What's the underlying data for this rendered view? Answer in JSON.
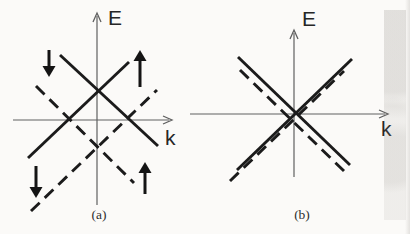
{
  "figure": {
    "background_color": "#fbfaf8",
    "band_color": "#1b1b1b",
    "axis_color": "#606060",
    "arrow_color": "#141414",
    "dash_pattern": "12 7",
    "panels": [
      {
        "id": "a",
        "caption": "(a)",
        "axes": {
          "y_label": "E",
          "x_label": "k",
          "x_axis": {
            "y": 120,
            "x_start": 13,
            "x_end": 172
          },
          "y_axis": {
            "x": 97,
            "y_top": 13,
            "y_bottom": 205
          }
        },
        "bands": [
          {
            "style": "solid",
            "name": "spin-up-band-upper",
            "from": [
              28,
              158
            ],
            "to": [
              129,
              62
            ]
          },
          {
            "style": "solid",
            "name": "spin-down-band-upper",
            "from": [
              60,
              55
            ],
            "to": [
              158,
              146
            ]
          },
          {
            "style": "dashed",
            "name": "spin-up-band-lower",
            "from": [
              31,
              211
            ],
            "to": [
              157,
              90
            ]
          },
          {
            "style": "dashed",
            "name": "spin-down-band-lower",
            "from": [
              36,
              86
            ],
            "to": [
              134,
              183
            ]
          }
        ],
        "spin_arrows": [
          {
            "icon": "spin-down-arrow",
            "direction": "down",
            "x": 49,
            "tail_y": 50,
            "tip_y": 77
          },
          {
            "icon": "spin-up-arrow",
            "direction": "up",
            "x": 140,
            "tail_y": 87,
            "tip_y": 50
          },
          {
            "icon": "spin-down-arrow",
            "direction": "down",
            "x": 36,
            "tail_y": 166,
            "tip_y": 198
          },
          {
            "icon": "spin-up-arrow",
            "direction": "up",
            "x": 145,
            "tail_y": 194,
            "tip_y": 162
          }
        ]
      },
      {
        "id": "b",
        "caption": "(b)",
        "axes": {
          "y_label": "E",
          "x_label": "k",
          "x_axis": {
            "y": 114,
            "x_start": 190,
            "x_end": 388
          },
          "y_axis": {
            "x": 294,
            "y_top": 30,
            "y_bottom": 177
          }
        },
        "bands": [
          {
            "style": "solid",
            "name": "spin-band-solid-ascending",
            "from": [
              237,
              170
            ],
            "to": [
              352,
              59
            ]
          },
          {
            "style": "solid",
            "name": "spin-band-solid-descending",
            "from": [
              238,
              57
            ],
            "to": [
              350,
              165
            ]
          },
          {
            "style": "dashed",
            "name": "spin-band-dashed-ascending",
            "from": [
              230,
              181
            ],
            "to": [
              344,
              71
            ]
          },
          {
            "style": "dashed",
            "name": "spin-band-dashed-descending",
            "from": [
              240,
              70
            ],
            "to": [
              345,
              172
            ]
          }
        ],
        "spin_arrows": []
      }
    ]
  }
}
